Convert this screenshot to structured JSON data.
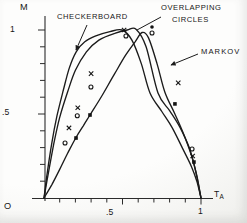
{
  "axis": {
    "y_title": "M",
    "x_title_main": "T",
    "x_title_sub": "A",
    "origin": "O",
    "y_tick_1": "1",
    "y_tick_05": ".5",
    "x_tick_05": ".5",
    "x_tick_1": "1"
  },
  "chart_data": {
    "type": "line",
    "title": "",
    "xlabel": "T_A",
    "ylabel": "M",
    "xlim": [
      0,
      1
    ],
    "ylim": [
      0,
      1
    ],
    "x_tick_step": 0.1,
    "y_tick_step": 0.1,
    "labeled_x_ticks": [
      0.5,
      1.0
    ],
    "labeled_y_ticks": [
      0.5,
      1.0
    ],
    "grid": false,
    "legend_position": "inline-annotations",
    "series": [
      {
        "name": "CHECKERBOARD",
        "points": [
          [
            0,
            0
          ],
          [
            0.022,
            0.16
          ],
          [
            0.05,
            0.33
          ],
          [
            0.083,
            0.49
          ],
          [
            0.12,
            0.63
          ],
          [
            0.16,
            0.77
          ],
          [
            0.205,
            0.87
          ],
          [
            0.26,
            0.93
          ],
          [
            0.33,
            0.965
          ],
          [
            0.42,
            0.99
          ],
          [
            0.497,
            1.0
          ],
          [
            0.56,
            0.94
          ],
          [
            0.62,
            0.8
          ],
          [
            0.675,
            0.625
          ],
          [
            0.75,
            0.515
          ],
          [
            0.815,
            0.42
          ],
          [
            0.88,
            0.3
          ],
          [
            0.94,
            0.185
          ],
          [
            0.975,
            0.095
          ],
          [
            1,
            0
          ]
        ]
      },
      {
        "name": "OVERLAPPING CIRCLES",
        "points": [
          [
            0,
            0
          ],
          [
            0.028,
            0.15
          ],
          [
            0.062,
            0.32
          ],
          [
            0.1,
            0.48
          ],
          [
            0.15,
            0.63
          ],
          [
            0.2,
            0.76
          ],
          [
            0.27,
            0.87
          ],
          [
            0.35,
            0.94
          ],
          [
            0.45,
            0.98
          ],
          [
            0.53,
            1.0
          ],
          [
            0.586,
            1.005
          ],
          [
            0.65,
            0.9
          ],
          [
            0.726,
            0.625
          ],
          [
            0.8,
            0.52
          ],
          [
            0.866,
            0.42
          ],
          [
            0.925,
            0.3
          ],
          [
            0.965,
            0.165
          ],
          [
            1,
            0
          ]
        ]
      },
      {
        "name": "MARKOV",
        "points": [
          [
            0,
            0
          ],
          [
            0.05,
            0.08
          ],
          [
            0.1,
            0.17
          ],
          [
            0.15,
            0.265
          ],
          [
            0.204,
            0.36
          ],
          [
            0.25,
            0.43
          ],
          [
            0.293,
            0.494
          ],
          [
            0.37,
            0.61
          ],
          [
            0.45,
            0.74
          ],
          [
            0.52,
            0.85
          ],
          [
            0.58,
            0.93
          ],
          [
            0.625,
            0.985
          ],
          [
            0.665,
            0.955
          ],
          [
            0.72,
            0.8
          ],
          [
            0.77,
            0.63
          ],
          [
            0.834,
            0.5
          ],
          [
            0.89,
            0.38
          ],
          [
            0.94,
            0.25
          ],
          [
            0.975,
            0.125
          ],
          [
            1,
            0
          ]
        ]
      }
    ],
    "scatter": [
      {
        "marker": "x",
        "points": [
          [
            0.51,
            1.0
          ],
          [
            0.3,
            0.74
          ],
          [
            0.215,
            0.537
          ],
          [
            0.159,
            0.417
          ],
          [
            0.855,
            0.685
          ],
          [
            0.947,
            0.25
          ]
        ]
      },
      {
        "marker": "o",
        "points": [
          [
            0.522,
            0.964
          ],
          [
            0.688,
            0.982
          ],
          [
            0.299,
            0.661
          ],
          [
            0.212,
            0.49
          ],
          [
            0.134,
            0.327
          ],
          [
            0.943,
            0.292
          ]
        ]
      },
      {
        "marker": "dot",
        "points": [
          [
            0.688,
            1.018
          ]
        ]
      },
      {
        "marker": "square",
        "points": [
          [
            0.204,
            0.357
          ],
          [
            0.293,
            0.494
          ],
          [
            0.834,
            0.56
          ],
          [
            0.955,
            0.214
          ]
        ]
      }
    ],
    "annotations": [
      {
        "id": "checkerboard",
        "text": "CHECKERBOARD",
        "leader": {
          "x1": 87,
          "y1": 25,
          "x2": 76,
          "y2": 50,
          "arrow": true
        }
      },
      {
        "id": "overlapping-circles",
        "lines": [
          "OVERLAPPING",
          "CIRCLES"
        ],
        "leader": {
          "x1": 161,
          "y1": 17,
          "x2": 137,
          "y2": 30,
          "arrow": false
        }
      },
      {
        "id": "markov",
        "text": "MARKOV",
        "leader": {
          "x1": 198,
          "y1": 54,
          "x2": 171,
          "y2": 65,
          "arrow": true
        }
      }
    ],
    "plot_geometry": {
      "origin_px": [
        44,
        198
      ],
      "x1_px": 201,
      "m1_py": 30
    }
  }
}
